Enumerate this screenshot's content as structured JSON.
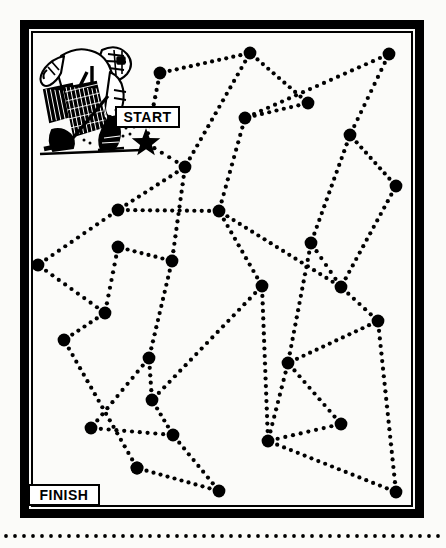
{
  "page": {
    "title": "Connect-the-dots maze puzzle",
    "background_color": "#fbfbf9",
    "ink_color": "#000000",
    "width": 446,
    "height": 548
  },
  "frame": {
    "name": "puzzle-border",
    "x": 20,
    "y": 20,
    "width": 404,
    "height": 498,
    "border_width": 9,
    "inner_border_width": 2,
    "color": "#000000"
  },
  "labels": {
    "start": "START",
    "finish": "FINISH"
  },
  "start_marker": {
    "shape": "star",
    "points": 5,
    "cx": 146,
    "cy": 143,
    "outer_radius": 15,
    "inner_radius": 6.2,
    "color": "#000000"
  },
  "illustration": {
    "name": "hockey-goalie-player",
    "jersey_number": "4",
    "description": "Ink drawing of a hockey goalie crouching with leg pads, blocker and stick",
    "x": 38,
    "y": 44,
    "width": 115,
    "height": 112
  },
  "bottom_rule": {
    "name": "dotted-rule",
    "y": 536,
    "x1": 6,
    "x2": 440,
    "dot_radius": 1.9,
    "spacing": 9
  },
  "maze": {
    "dot_radius": 6.4,
    "trail_dot_radius": 2.1,
    "trail_spacing": 7.5,
    "nodes": [
      {
        "id": "n1",
        "x": 160,
        "y": 73
      },
      {
        "id": "n2",
        "x": 250,
        "y": 53
      },
      {
        "id": "n3",
        "x": 308,
        "y": 103
      },
      {
        "id": "n4",
        "x": 389,
        "y": 54
      },
      {
        "id": "n5",
        "x": 245,
        "y": 118
      },
      {
        "id": "n6",
        "x": 350,
        "y": 135
      },
      {
        "id": "n7",
        "x": 185,
        "y": 167
      },
      {
        "id": "n8",
        "x": 396,
        "y": 186
      },
      {
        "id": "n9",
        "x": 118,
        "y": 210
      },
      {
        "id": "n10",
        "x": 219,
        "y": 211
      },
      {
        "id": "n11",
        "x": 311,
        "y": 243
      },
      {
        "id": "n12",
        "x": 118,
        "y": 247
      },
      {
        "id": "n13",
        "x": 38,
        "y": 265
      },
      {
        "id": "n14",
        "x": 172,
        "y": 261
      },
      {
        "id": "n15",
        "x": 262,
        "y": 286
      },
      {
        "id": "n16",
        "x": 341,
        "y": 287
      },
      {
        "id": "n17",
        "x": 105,
        "y": 313
      },
      {
        "id": "n18",
        "x": 378,
        "y": 321
      },
      {
        "id": "n19",
        "x": 64,
        "y": 340
      },
      {
        "id": "n20",
        "x": 149,
        "y": 358
      },
      {
        "id": "n21",
        "x": 288,
        "y": 363
      },
      {
        "id": "n22",
        "x": 152,
        "y": 400
      },
      {
        "id": "n23",
        "x": 91,
        "y": 428
      },
      {
        "id": "n24",
        "x": 173,
        "y": 435
      },
      {
        "id": "n25",
        "x": 341,
        "y": 424
      },
      {
        "id": "n26",
        "x": 268,
        "y": 441
      },
      {
        "id": "n27",
        "x": 137,
        "y": 468
      },
      {
        "id": "n28",
        "x": 219,
        "y": 491
      },
      {
        "id": "n29",
        "x": 396,
        "y": 492
      },
      {
        "id": "star",
        "x": 146,
        "y": 143
      },
      {
        "id": "fin",
        "x": 137,
        "y": 468
      }
    ],
    "edges": [
      [
        "star",
        "n1"
      ],
      [
        "star",
        "n7"
      ],
      [
        "n1",
        "n2"
      ],
      [
        "n2",
        "n3"
      ],
      [
        "n2",
        "n7"
      ],
      [
        "n3",
        "n5"
      ],
      [
        "n4",
        "n5"
      ],
      [
        "n4",
        "n6"
      ],
      [
        "n5",
        "n10"
      ],
      [
        "n6",
        "n8"
      ],
      [
        "n6",
        "n11"
      ],
      [
        "n7",
        "n9"
      ],
      [
        "n7",
        "n14"
      ],
      [
        "n8",
        "n16"
      ],
      [
        "n9",
        "n10"
      ],
      [
        "n9",
        "n13"
      ],
      [
        "n10",
        "n15"
      ],
      [
        "n10",
        "n16"
      ],
      [
        "n11",
        "n16"
      ],
      [
        "n11",
        "n21"
      ],
      [
        "n12",
        "n14"
      ],
      [
        "n12",
        "n17"
      ],
      [
        "n13",
        "n17"
      ],
      [
        "n14",
        "n20"
      ],
      [
        "n15",
        "n22"
      ],
      [
        "n15",
        "n26"
      ],
      [
        "n16",
        "n18"
      ],
      [
        "n17",
        "n19"
      ],
      [
        "n18",
        "n21"
      ],
      [
        "n18",
        "n29"
      ],
      [
        "n19",
        "n27"
      ],
      [
        "n20",
        "n22"
      ],
      [
        "n20",
        "n23"
      ],
      [
        "n21",
        "n25"
      ],
      [
        "n21",
        "n26"
      ],
      [
        "n22",
        "n24"
      ],
      [
        "n23",
        "n24"
      ],
      [
        "n24",
        "n28"
      ],
      [
        "n25",
        "n26"
      ],
      [
        "n26",
        "n29"
      ],
      [
        "n27",
        "n28"
      ]
    ]
  }
}
